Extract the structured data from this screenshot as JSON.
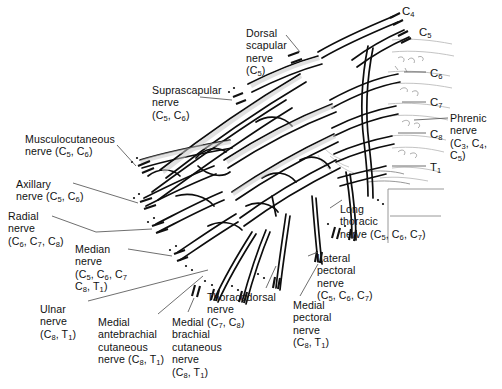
{
  "figure": {
    "type": "anatomical-line-diagram",
    "background_color": "#ffffff",
    "ink_color": "#0d0d0d",
    "leader_line_color": "#4a4a4a"
  },
  "labels": [
    {
      "id": "dorsal-scapular",
      "name": "Dorsal scapular nerve",
      "roots": "(C5)",
      "lines": [
        "Dorsal",
        "scapular",
        "nerve",
        "(C5)"
      ],
      "align": "left",
      "x": 246,
      "y": 27
    },
    {
      "id": "suprascapular",
      "name": "Suprascapular nerve",
      "roots": "(C5, C6)",
      "lines": [
        "Suprascapular",
        "nerve",
        "(C5, C6)"
      ],
      "align": "left",
      "x": 152,
      "y": 84
    },
    {
      "id": "musculocutaneous",
      "name": "Musculocutaneous nerve",
      "roots": "(C5, C6)",
      "lines": [
        "Musculocutaneous",
        "nerve (C5, C6)"
      ],
      "align": "left",
      "x": 25,
      "y": 133
    },
    {
      "id": "axillary",
      "name": "Axillary nerve",
      "roots": "(C5, C6)",
      "lines": [
        "Axillary",
        "nerve (C5, C6)"
      ],
      "align": "left",
      "x": 16,
      "y": 178
    },
    {
      "id": "radial",
      "name": "Radial nerve",
      "roots": "(C6, C7, C8)",
      "lines": [
        "Radial",
        "nerve",
        "(C6, C7, C8)"
      ],
      "align": "left",
      "x": 8,
      "y": 210
    },
    {
      "id": "median",
      "name": "Median nerve",
      "roots": "(C5, C6, C7, C8, T1)",
      "lines": [
        "Median",
        "nerve",
        "(C5, C6, C7",
        "C8, T1)"
      ],
      "align": "left",
      "x": 75,
      "y": 243
    },
    {
      "id": "ulnar",
      "name": "Ulnar nerve",
      "roots": "(C8, T1)",
      "lines": [
        "Ulnar",
        "nerve",
        "(C8, T1)"
      ],
      "align": "left",
      "x": 40,
      "y": 303
    },
    {
      "id": "medial-antebrachial-cutaneous",
      "name": "Medial antebrachial cutaneous nerve",
      "roots": "(C8, T1)",
      "lines": [
        "Medial",
        "antebrachial",
        "cutaneous",
        "nerve (C8, T1)"
      ],
      "align": "left",
      "x": 98,
      "y": 316
    },
    {
      "id": "medial-brachial-cutaneous",
      "name": "Medial brachial cutaneous nerve",
      "roots": "(C8, T1)",
      "lines": [
        "Medial",
        "brachial",
        "cutaneous",
        "nerve",
        "(C8, T1)"
      ],
      "align": "left",
      "x": 172,
      "y": 316
    },
    {
      "id": "thoracodorsal",
      "name": "Thoracodorsal nerve",
      "roots": "(C7, C8)",
      "lines": [
        "Thoracodorsal",
        "nerve",
        "(C7, C8)"
      ],
      "align": "left",
      "x": 207,
      "y": 291
    },
    {
      "id": "long-thoracic",
      "name": "Long thoracic nerve",
      "roots": "(C5, C6, C7)",
      "lines": [
        "Long",
        "thoracic",
        "nerve (C5, C6, C7)"
      ],
      "align": "left",
      "x": 340,
      "y": 203
    },
    {
      "id": "lateral-pectoral",
      "name": "Lateral pectoral nerve",
      "roots": "(C5, C6, C7)",
      "lines": [
        "Lateral",
        "pectoral",
        "nerve",
        "(C5, C6, C7)"
      ],
      "align": "left",
      "x": 317,
      "y": 252
    },
    {
      "id": "medial-pectoral",
      "name": "Medial pectoral nerve",
      "roots": "(C8, T1)",
      "lines": [
        "Medial",
        "pectoral",
        "nerve",
        "(C8, T1)"
      ],
      "align": "left",
      "x": 293,
      "y": 299
    },
    {
      "id": "phrenic",
      "name": "Phrenic nerve",
      "roots": "(C3, C4, C5)",
      "lines": [
        "Phrenic",
        "nerve",
        "(C3, C4, C5)"
      ],
      "align": "left",
      "x": 450,
      "y": 112
    }
  ],
  "roots": [
    {
      "id": "c4",
      "label": "C4",
      "x": 402,
      "y": 5
    },
    {
      "id": "c5",
      "label": "C5",
      "x": 419,
      "y": 26
    },
    {
      "id": "c6",
      "label": "C6",
      "x": 430,
      "y": 67
    },
    {
      "id": "c7",
      "label": "C7",
      "x": 430,
      "y": 96
    },
    {
      "id": "c8",
      "label": "C8",
      "x": 430,
      "y": 128
    },
    {
      "id": "t1",
      "label": "T1",
      "x": 430,
      "y": 161
    }
  ]
}
